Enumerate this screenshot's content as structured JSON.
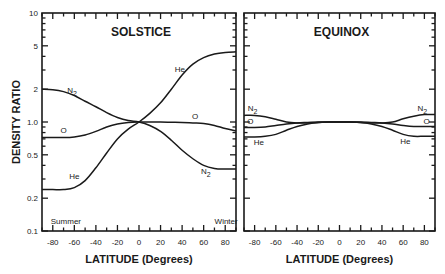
{
  "chart_data": {
    "type": "line",
    "ylabel": "DENSITY RATIO",
    "yscale": "log",
    "ylim": [
      0.1,
      10
    ],
    "y_ticks": [
      0.1,
      0.2,
      0.5,
      1.0,
      2,
      5,
      10
    ],
    "y_tick_labels": [
      "0.1",
      "0.2",
      "0.5",
      "1.0",
      "2",
      "5",
      "10"
    ],
    "grid": false,
    "legend": "inline curve labels",
    "panels": [
      {
        "title": "SOLSTICE",
        "xlabel": "LATITUDE (Degrees)",
        "xlim": [
          -90,
          90
        ],
        "x_ticks": [
          -80,
          -60,
          -40,
          -20,
          0,
          20,
          40,
          60,
          80
        ],
        "x_tick_labels": [
          "-80",
          "-60",
          "-40",
          "-20",
          "0",
          "20",
          "40",
          "60",
          "80"
        ],
        "annotations": [
          {
            "text": "Summer",
            "x": -80,
            "y": 0.115
          },
          {
            "text": "Winter",
            "x": 72,
            "y": 0.115
          }
        ],
        "x": [
          -90,
          -80,
          -70,
          -60,
          -50,
          -40,
          -30,
          -20,
          -10,
          0,
          10,
          20,
          30,
          40,
          50,
          60,
          70,
          80,
          90
        ],
        "series": [
          {
            "name": "N2",
            "values": [
              2.0,
              1.98,
              1.9,
              1.75,
              1.55,
              1.38,
              1.22,
              1.1,
              1.03,
              1.0,
              0.93,
              0.82,
              0.68,
              0.55,
              0.46,
              0.4,
              0.375,
              0.37,
              0.37
            ],
            "label_pos": {
              "x": -62,
              "y": 1.85
            },
            "label2_pos": {
              "x": 62,
              "y": 0.33
            }
          },
          {
            "name": "O",
            "values": [
              0.72,
              0.72,
              0.72,
              0.73,
              0.76,
              0.82,
              0.9,
              0.96,
              0.99,
              1.0,
              1.0,
              1.0,
              0.995,
              0.99,
              0.98,
              0.97,
              0.93,
              0.87,
              0.83
            ],
            "label_pos": {
              "x": -70,
              "y": 0.8
            },
            "label2_pos": {
              "x": 52,
              "y": 1.06
            }
          },
          {
            "name": "He",
            "values": [
              0.24,
              0.24,
              0.24,
              0.25,
              0.29,
              0.38,
              0.52,
              0.7,
              0.86,
              1.0,
              1.2,
              1.5,
              2.0,
              2.7,
              3.4,
              3.9,
              4.2,
              4.35,
              4.4
            ],
            "label_pos": {
              "x": -60,
              "y": 0.3
            },
            "label2_pos": {
              "x": 38,
              "y": 2.9
            }
          }
        ]
      },
      {
        "title": "EQUINOX",
        "xlabel": "LATITUDE (Degrees)",
        "xlim": [
          -90,
          90
        ],
        "x_ticks": [
          -80,
          -60,
          -40,
          -20,
          0,
          20,
          40,
          60,
          80
        ],
        "x_tick_labels": [
          "-80",
          "-60",
          "-40",
          "-20",
          "0",
          "20",
          "40",
          "60",
          "80"
        ],
        "annotations": [],
        "x": [
          -90,
          -80,
          -70,
          -60,
          -50,
          -40,
          -30,
          -20,
          -10,
          0,
          10,
          20,
          30,
          40,
          50,
          60,
          70,
          80,
          90
        ],
        "series": [
          {
            "name": "N2",
            "values": [
              1.15,
              1.15,
              1.12,
              1.06,
              1.0,
              0.98,
              0.98,
              0.99,
              1.0,
              1.0,
              1.0,
              0.99,
              0.98,
              0.98,
              1.0,
              1.07,
              1.13,
              1.17,
              1.17
            ],
            "label_pos": {
              "x": -82,
              "y": 1.25
            },
            "label2_pos": {
              "x": 78,
              "y": 1.27
            }
          },
          {
            "name": "O",
            "values": [
              0.89,
              0.89,
              0.9,
              0.93,
              0.96,
              0.98,
              0.99,
              1.0,
              1.0,
              1.0,
              1.0,
              1.0,
              0.99,
              0.98,
              0.96,
              0.93,
              0.91,
              0.91,
              0.91
            ],
            "label_pos": {
              "x": -84,
              "y": 0.96
            },
            "label2_pos": {
              "x": 82,
              "y": 0.96
            }
          },
          {
            "name": "He",
            "values": [
              0.73,
              0.73,
              0.74,
              0.77,
              0.84,
              0.91,
              0.96,
              0.99,
              1.0,
              1.0,
              1.0,
              0.99,
              0.96,
              0.91,
              0.84,
              0.77,
              0.74,
              0.74,
              0.74
            ],
            "label_pos": {
              "x": -76,
              "y": 0.62
            },
            "label2_pos": {
              "x": 62,
              "y": 0.63
            }
          }
        ]
      }
    ]
  },
  "layout": {
    "panels_px": [
      {
        "left": 42,
        "right": 236,
        "top": 13,
        "bottom": 231
      },
      {
        "left": 244,
        "right": 435,
        "top": 13,
        "bottom": 231
      }
    ]
  }
}
